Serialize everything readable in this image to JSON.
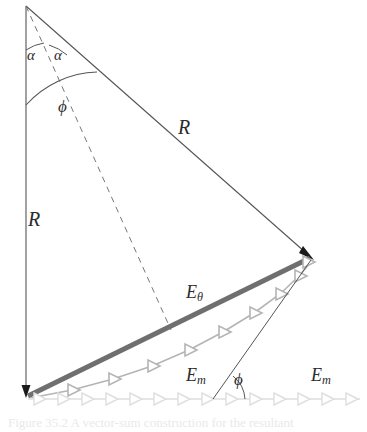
{
  "figure": {
    "kind": "phasor-vector-addition-diagram",
    "background_color": "#ffffff",
    "width": 367,
    "height": 432
  },
  "colors": {
    "thin_line": "#555555",
    "dashed_line": "#777777",
    "arc_line": "#555555",
    "resultant_thick": "#6f6f6f",
    "chain_medium": "#b4b4b4",
    "chain_light": "#dedede",
    "arrowhead_dark": "#1a1a1a",
    "label_text": "#2b2b2b",
    "caption_text": "#e9e9e9"
  },
  "geometry": {
    "apex": {
      "x": 26,
      "y": 6
    },
    "bottom_left": {
      "x": 26,
      "y": 397
    },
    "right_vertex": {
      "x": 313,
      "y": 259
    },
    "chord_midpoint": {
      "x": 170,
      "y": 328
    },
    "phi_foot": {
      "x": 213,
      "y": 399
    },
    "bottom_axis_y": 399,
    "bottom_axis_x_end": 360,
    "medium_chain_segments": 10,
    "light_chain_segments": 14
  },
  "labels": {
    "radius_left": {
      "text": "R",
      "x": 28,
      "y": 209,
      "role": "left-radius-label"
    },
    "radius_diagonal": {
      "text": "R",
      "x": 178,
      "y": 117,
      "role": "diagonal-radius-label"
    },
    "alpha_left": {
      "text": "α",
      "x": 27,
      "y": 48,
      "role": "half-angle-left"
    },
    "alpha_right": {
      "text": "α",
      "x": 54,
      "y": 48,
      "role": "half-angle-right"
    },
    "phi_apex": {
      "text": "ϕ",
      "x": 58,
      "y": 98,
      "role": "apex-full-angle"
    },
    "phi_bottom": {
      "text": "ϕ",
      "x": 234,
      "y": 371,
      "role": "bottom-phase-angle"
    },
    "e_theta": {
      "base": "E",
      "sub": "θ",
      "x": 186,
      "y": 283,
      "role": "resultant-amplitude-label"
    },
    "e_m_inner": {
      "base": "E",
      "sub": "m",
      "x": 186,
      "y": 366,
      "role": "individual-amplitude-label-inner"
    },
    "e_m_outer": {
      "base": "E",
      "sub": "m",
      "x": 311,
      "y": 366,
      "role": "individual-amplitude-label-outer"
    }
  },
  "caption": {
    "number": "Figure 35.2",
    "text": "Figure 35.2  A vector-sum construction for the resultant"
  }
}
